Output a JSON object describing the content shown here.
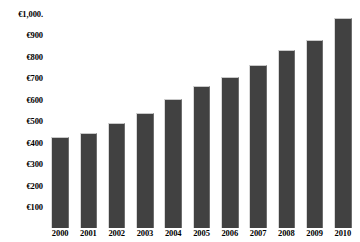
{
  "chart_data": {
    "type": "bar",
    "title": "",
    "xlabel": "",
    "ylabel": "",
    "categories": [
      "2000",
      "2001",
      "2002",
      "2003",
      "2004",
      "2005",
      "2006",
      "2007",
      "2008",
      "2009",
      "2010"
    ],
    "values": [
      425,
      445,
      490,
      535,
      600,
      660,
      705,
      760,
      830,
      875,
      980
    ],
    "ytick_labels": [
      "€1,000.",
      "€900",
      "€800",
      "€700",
      "€600",
      "€500",
      "€400",
      "€300",
      "€200",
      "€100"
    ],
    "ytick_values": [
      1000,
      900,
      800,
      700,
      600,
      500,
      400,
      300,
      200,
      100
    ],
    "ylim": [
      0,
      1035
    ],
    "grid": false,
    "legend": "none",
    "currency_symbol": "€",
    "bar_color": "#414141",
    "background_color": "#ffffff",
    "axis_text_color": "#000000",
    "series_name": "Value"
  },
  "caption": {
    "label": "",
    "text": ""
  }
}
